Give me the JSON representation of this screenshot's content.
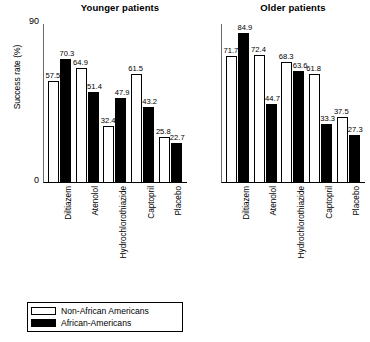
{
  "chart_data": {
    "type": "bar",
    "title": "",
    "panels": [
      {
        "title": "Younger patients",
        "categories": [
          "Diltiazem",
          "Atenolol",
          "Hydrochlorothiazide",
          "Captopril",
          "Placebo"
        ],
        "series": [
          {
            "name": "Non-African Americans",
            "values": [
              57.5,
              64.9,
              32.4,
              61.5,
              25.8
            ]
          },
          {
            "name": "African-Americans",
            "values": [
              70.3,
              51.4,
              47.9,
              43.2,
              22.7
            ]
          }
        ]
      },
      {
        "title": "Older patients",
        "categories": [
          "Diltiazem",
          "Atenolol",
          "Hydrochlorothiazide",
          "Captopril",
          "Placebo"
        ],
        "series": [
          {
            "name": "Non-African Americans",
            "values": [
              71.7,
              72.4,
              68.3,
              61.8,
              37.5
            ]
          },
          {
            "name": "African-Americans",
            "values": [
              84.9,
              44.7,
              63.6,
              33.3,
              27.3
            ]
          }
        ]
      }
    ],
    "ylabel": "Success rate (%)",
    "xlabel": "",
    "ylim": [
      0,
      90
    ],
    "yticks": [
      "0",
      "90"
    ],
    "grid": false,
    "legend": {
      "position": "bottom-left",
      "entries": [
        {
          "label": "Non-African Americans",
          "color": "#ffffff"
        },
        {
          "label": "African-Americans",
          "color": "#000000"
        }
      ]
    }
  },
  "axis": {
    "y_label": "Success rate (%)",
    "y_top": "90",
    "y_zero": "0",
    "y_max": 90
  },
  "legend": {
    "items": [
      {
        "label": "Non-African Americans",
        "fill": "white"
      },
      {
        "label": "African-Americans",
        "fill": "black"
      }
    ]
  },
  "colors": {
    "non_african_americans": "#ffffff",
    "african_americans": "#000000",
    "axis": "#000000"
  }
}
